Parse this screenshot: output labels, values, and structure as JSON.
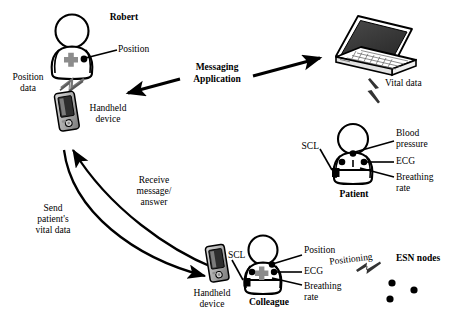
{
  "figure": {
    "width": 457,
    "height": 318,
    "background_color": "#ffffff",
    "ink_color": "#000000",
    "accent_gray": "#8c8c8c"
  },
  "actors": [
    {
      "id": "robert",
      "name": "Robert",
      "type": "person",
      "sensors": [
        "position-dot",
        "gray-cross-badge"
      ]
    },
    {
      "id": "patient",
      "name": "Patient",
      "type": "person",
      "sensors": [
        "neck-dot",
        "chest-dot-left",
        "chest-dot-right",
        "scl-box"
      ]
    },
    {
      "id": "colleague",
      "name": "Colleague",
      "type": "person",
      "sensors": [
        "position-dot",
        "gray-cross-badge",
        "ecg-dot",
        "scl-box"
      ]
    }
  ],
  "devices": [
    {
      "id": "handheld-robert",
      "label_line1": "Handheld",
      "label_line2": "device",
      "type": "handheld"
    },
    {
      "id": "handheld-colleague",
      "label_line1": "Handheld",
      "label_line2": "device",
      "type": "handheld"
    },
    {
      "id": "laptop",
      "label": "",
      "type": "laptop"
    }
  ],
  "labels": {
    "robert": "Robert",
    "position": "Position",
    "position_data_line1": "Position",
    "position_data_line2": "data",
    "handheld_line1": "Handheld",
    "handheld_line2": "device",
    "messaging_line1": "Messaging",
    "messaging_line2": "Application",
    "vital_data": "Vital data",
    "scl_patient": "SCL",
    "blood_pressure_line1": "Blood",
    "blood_pressure_line2": "pressure",
    "ecg_patient": "ECG",
    "breathing_rate_line1": "Breathing",
    "breathing_rate_line2": "rate",
    "patient": "Patient",
    "receive_line1": "Receive",
    "receive_line2": "message/",
    "receive_line3": "answer",
    "send_line1": "Send",
    "send_line2": "patient's",
    "send_line3": "vital data",
    "handheld2_line1": "Handheld",
    "handheld2_line2": "device",
    "scl_colleague": "SCL",
    "position_colleague": "Position",
    "ecg_colleague": "ECG",
    "breathing_colleague_line1": "Breathing",
    "breathing_colleague_line2": "rate",
    "colleague": "Colleague",
    "positioning": "Positioning",
    "esn_nodes": "ESN nodes"
  },
  "connections": [
    {
      "id": "robert-to-handheld",
      "style": "lightning",
      "label": "Position data",
      "from": "robert",
      "to": "handheld-robert"
    },
    {
      "id": "messaging-left",
      "style": "arrow",
      "label": "Messaging Application",
      "direction": "left"
    },
    {
      "id": "messaging-right",
      "style": "arrow",
      "label": "Messaging Application",
      "direction": "right"
    },
    {
      "id": "laptop-to-patient",
      "style": "lightning",
      "label": "Vital data",
      "from": "laptop",
      "to": "patient"
    },
    {
      "id": "receive-message-answer",
      "style": "curved-arrow",
      "label": "Receive message/ answer",
      "from": "handheld-robert",
      "to": "handheld-colleague"
    },
    {
      "id": "send-vital-data",
      "style": "curved-arrow",
      "label": "Send patient's vital data",
      "from": "handheld-colleague",
      "to": "handheld-robert"
    },
    {
      "id": "positioning-esn",
      "style": "lightning",
      "label": "Positioning",
      "from": "esn-nodes",
      "to": "colleague"
    }
  ],
  "esn_nodes": {
    "label": "ESN nodes",
    "node_count": 3
  }
}
